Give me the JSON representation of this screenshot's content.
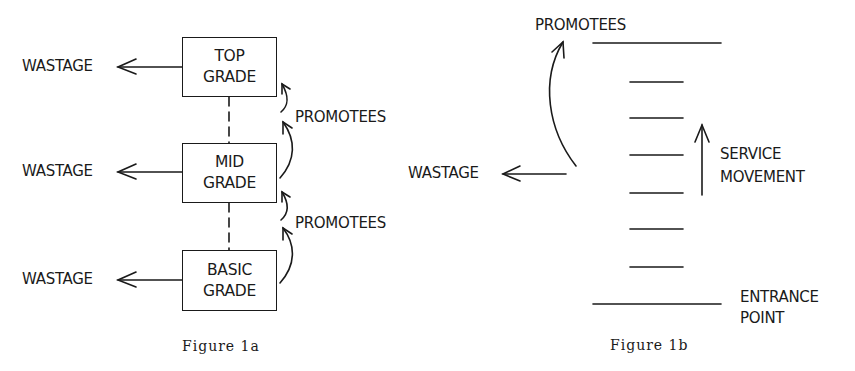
{
  "figure_1a": {
    "caption": "Figure 1a",
    "grades": [
      {
        "line1": "TOP",
        "line2": "GRADE",
        "outflow": "WASTAGE"
      },
      {
        "line1": "MID",
        "line2": "GRADE",
        "outflow": "WASTAGE"
      },
      {
        "line1": "BASIC",
        "line2": "GRADE",
        "outflow": "WASTAGE"
      }
    ],
    "promotion_labels": [
      "PROMOTEES",
      "PROMOTEES"
    ]
  },
  "figure_1b": {
    "caption": "Figure 1b",
    "top_label": "PROMOTEES",
    "wastage_label": "WASTAGE",
    "movement_label": {
      "line1": "SERVICE",
      "line2": "MOVEMENT"
    },
    "entrance_label": {
      "line1": "ENTRANCE",
      "line2": "POINT"
    },
    "service_levels": 6
  }
}
